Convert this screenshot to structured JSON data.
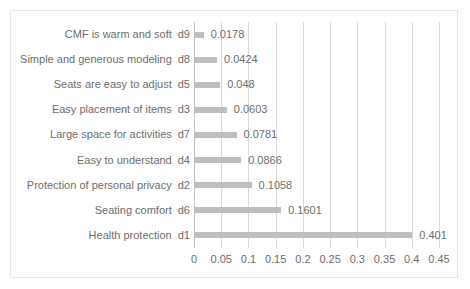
{
  "chart_data": {
    "type": "bar",
    "orientation": "horizontal",
    "title": "",
    "subtitle": "",
    "xlabel": "",
    "ylabel": "",
    "xlim": [
      0,
      0.45
    ],
    "xticks": [
      "0",
      "0.05",
      "0.1",
      "0.15",
      "0.2",
      "0.25",
      "0.3",
      "0.35",
      "0.4",
      "0.45"
    ],
    "xtick_values": [
      0,
      0.05,
      0.1,
      0.15,
      0.2,
      0.25,
      0.3,
      0.35,
      0.4,
      0.45
    ],
    "grid": "vertical",
    "legend": "none",
    "bar_color": "#bfbfbf",
    "gridline_color": "#d9d9d9",
    "text_color": "#6e6e6e",
    "categories": [
      "CMF is warm and soft",
      "Simple and generous modeling",
      "Seats are easy to adjust",
      "Easy placement of items",
      "Large space for activities",
      "Easy to understand",
      "Protection of personal privacy",
      "Seating comfort",
      "Health protection"
    ],
    "category_codes": [
      "d9",
      "d8",
      "d5",
      "d3",
      "d7",
      "d4",
      "d2",
      "d6",
      "d1"
    ],
    "values": [
      0.0178,
      0.0424,
      0.048,
      0.0603,
      0.0781,
      0.0866,
      0.1058,
      0.1601,
      0.401
    ],
    "value_labels": [
      "0.0178",
      "0.0424",
      "0.048",
      "0.0603",
      "0.0781",
      "0.0866",
      "0.1058",
      "0.1601",
      "0.401"
    ],
    "series": [
      {
        "name": "weight",
        "values": [
          0.0178,
          0.0424,
          0.048,
          0.0603,
          0.0781,
          0.0866,
          0.1058,
          0.1601,
          0.401
        ]
      }
    ]
  }
}
